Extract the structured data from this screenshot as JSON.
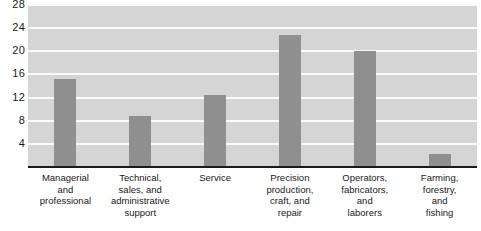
{
  "chart_data": {
    "type": "bar",
    "title": "",
    "xlabel": "",
    "ylabel": "",
    "ylim": [
      0,
      28
    ],
    "grid": true,
    "legend": null,
    "yticks": [
      28,
      24,
      20,
      16,
      12,
      8,
      4
    ],
    "categories": [
      "Managerial and professional",
      "Technical, sales, and administrative support",
      "Service",
      "Precision production, craft, and repair",
      "Operators, fabricators, and laborers",
      "Farming, forestry, and fishing"
    ],
    "category_lines": [
      [
        "Managerial",
        "and",
        "professional"
      ],
      [
        "Technical,",
        "sales, and",
        "administrative",
        "support"
      ],
      [
        "Service"
      ],
      [
        "Precision",
        "production,",
        "craft, and",
        "repair"
      ],
      [
        "Operators,",
        "fabricators,",
        "and",
        "laborers"
      ],
      [
        "Farming,",
        "forestry,",
        "and",
        "fishing"
      ]
    ],
    "values": [
      15.0,
      8.7,
      12.3,
      22.6,
      19.8,
      2.0
    ],
    "colors": {
      "bar": "#8f8f8f",
      "plot_background": "#d5d5d5",
      "gridline": "#fbfbfb",
      "axis": "#1a1a1a",
      "text": "#1a1a1a"
    }
  }
}
